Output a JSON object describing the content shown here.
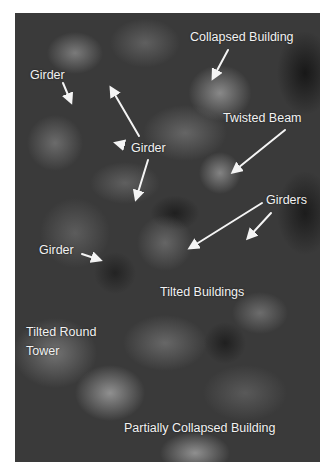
{
  "image": {
    "description": "Grayscale aerial photograph of collapsed and damaged buildings with annotation labels and arrows",
    "background_color": "#ffffff",
    "label_color": "#f2f2f2"
  },
  "labels": {
    "collapsed_building": "Collapsed Building",
    "girder_top_left": "Girder",
    "girder_center": "Girder",
    "twisted_beam": "Twisted Beam",
    "girders": "Girders",
    "girder_left": "Girder",
    "tilted_buildings": "Tilted Buildings",
    "tilted_round_tower_line1": "Tilted Round",
    "tilted_round_tower_line2": "Tower",
    "partially_collapsed_building": "Partially Collapsed Building"
  },
  "arrows": [
    {
      "name": "collapsed-building-arrow",
      "from": [
        228,
        50
      ],
      "to": [
        213,
        78
      ]
    },
    {
      "name": "girder-top-left-arrow",
      "from": [
        63,
        83
      ],
      "to": [
        71,
        102
      ]
    },
    {
      "name": "girder-center-up-arrow",
      "from": [
        139,
        136
      ],
      "to": [
        111,
        88
      ]
    },
    {
      "name": "girder-center-left-arrowhead",
      "from": [
        124,
        145
      ],
      "to": [
        116,
        143
      ]
    },
    {
      "name": "girder-center-down-arrow",
      "from": [
        148,
        160
      ],
      "to": [
        136,
        199
      ]
    },
    {
      "name": "twisted-beam-arrow",
      "from": [
        285,
        130
      ],
      "to": [
        233,
        172
      ]
    },
    {
      "name": "girders-arrow-1",
      "from": [
        262,
        203
      ],
      "to": [
        190,
        248
      ]
    },
    {
      "name": "girders-arrow-2",
      "from": [
        271,
        213
      ],
      "to": [
        248,
        238
      ]
    },
    {
      "name": "girder-left-arrow",
      "from": [
        82,
        254
      ],
      "to": [
        100,
        260
      ]
    }
  ]
}
